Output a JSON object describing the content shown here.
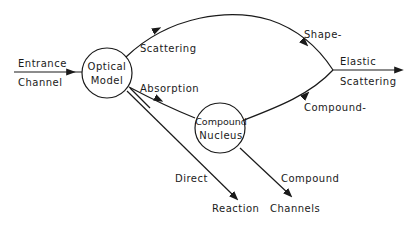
{
  "diagram": {
    "nodes": {
      "optical_model": {
        "line1": "Optical",
        "line2": "Model"
      },
      "compound_nucleus": {
        "line1": "Compound",
        "line2": "Nucleus"
      }
    },
    "labels": {
      "entrance": "Entrance",
      "channel": "Channel",
      "scattering": "Scattering",
      "absorption": "Absorption",
      "shape": "Shape-",
      "compound_dash": "Compound-",
      "elastic": "Elastic",
      "elastic_scattering": "Scattering",
      "direct": "Direct",
      "reaction": "Reaction",
      "compound": "Compound",
      "channels": "Channels"
    },
    "colors": {
      "ink": "#1a1a1a",
      "background": "#ffffff"
    }
  }
}
